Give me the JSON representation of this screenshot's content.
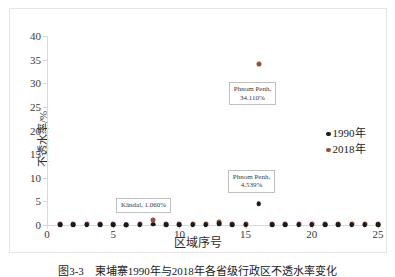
{
  "figure": {
    "caption": "图3-3　柬埔寨1990年与2018年各省级行政区不透水率变化"
  },
  "chart_data": {
    "type": "scatter",
    "title": "",
    "xlabel": "区域序号",
    "ylabel": "不透水率/%",
    "xlim": [
      0,
      25
    ],
    "ylim": [
      0,
      40
    ],
    "xticks": [
      0,
      5,
      10,
      15,
      20,
      25
    ],
    "yticks": [
      0,
      5,
      10,
      15,
      20,
      25,
      30,
      35,
      40
    ],
    "grid": false,
    "legend_position": "right",
    "colors": {
      "series_1990": "#1a1a1a",
      "series_2018": "#96513f",
      "axis": "#d9d9d9",
      "callout_border": "#bfbfbf",
      "frame": "#e6e6e6"
    },
    "series": [
      {
        "name": "1990年",
        "color": "#1a1a1a",
        "x": [
          1,
          2,
          3,
          4,
          5,
          6,
          7,
          8,
          9,
          10,
          11,
          12,
          13,
          14,
          15,
          16,
          17,
          18,
          19,
          20,
          21,
          22,
          23,
          24,
          25
        ],
        "values": [
          0.02,
          0.03,
          0.02,
          0.03,
          0.04,
          0.02,
          0.03,
          0.18,
          0.03,
          0.04,
          0.03,
          0.03,
          0.21,
          0.03,
          0.04,
          4.539,
          0.03,
          0.02,
          0.03,
          0.04,
          0.05,
          0.03,
          0.04,
          0.02,
          0.03
        ]
      },
      {
        "name": "2018年",
        "color": "#96513f",
        "x": [
          1,
          2,
          3,
          4,
          5,
          6,
          7,
          8,
          9,
          10,
          11,
          12,
          13,
          14,
          15,
          16,
          17,
          18,
          19,
          20,
          21,
          22,
          23,
          24,
          25
        ],
        "values": [
          0.12,
          0.16,
          0.11,
          0.14,
          0.18,
          0.1,
          0.13,
          1.06,
          0.15,
          0.17,
          0.12,
          0.14,
          0.62,
          0.16,
          0.19,
          34.11,
          0.13,
          0.11,
          0.15,
          0.18,
          0.22,
          0.14,
          0.17,
          0.12,
          0.15
        ]
      }
    ],
    "annotations": [
      {
        "id": "ann-phnom-penh-2018",
        "text_line1": "Phnom Penh,",
        "text_line2": "34.110%",
        "series": "2018年",
        "x": 16,
        "y": 34.11
      },
      {
        "id": "ann-phnom-penh-1990",
        "text_line1": "Phnom Penh,",
        "text_line2": "4.539%",
        "series": "1990年",
        "x": 16,
        "y": 4.539
      },
      {
        "id": "ann-kandal-2018",
        "text_line1": "Kândal, 1.060%",
        "text_line2": "",
        "series": "2018年",
        "x": 8,
        "y": 1.06
      }
    ],
    "legend": [
      {
        "label": "1990年",
        "color": "#1a1a1a"
      },
      {
        "label": "2018年",
        "color": "#96513f"
      }
    ]
  }
}
